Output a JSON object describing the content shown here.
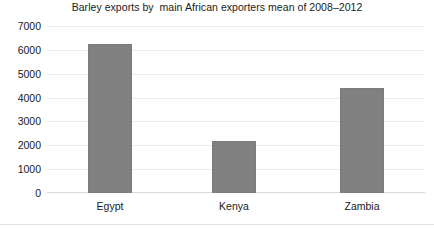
{
  "chart_data": {
    "type": "bar",
    "title": "Barley exports by  main African exporters mean of 2008–2012",
    "xlabel": "",
    "ylabel": "",
    "categories": [
      "Egypt",
      "Kenya",
      "Zambia"
    ],
    "values": [
      6250,
      2200,
      4400
    ],
    "series": [
      {
        "name": "Barley exports",
        "values": [
          6250,
          2200,
          4400
        ]
      }
    ],
    "ylim": [
      0,
      7000
    ],
    "yticks": [
      7000,
      6000,
      5000,
      4000,
      3000,
      2000,
      1000,
      0
    ],
    "ytick_labels": [
      "7000",
      "6000",
      "5000",
      "4000",
      "3000",
      "2000",
      "1000",
      "0"
    ],
    "grid": true,
    "grid_axis": "y",
    "legend": false,
    "legend_position": "none",
    "bar_color": "#808080",
    "bar_edge_color": "#7b7b7b",
    "gridline_color": "#ededed",
    "background_color": "#ffffff",
    "text_color": "#1a1a1a"
  }
}
